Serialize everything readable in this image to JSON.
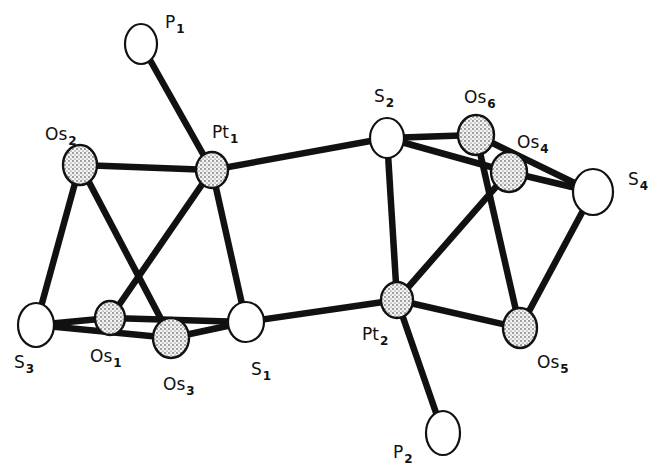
{
  "figure": {
    "type": "molecular structure (ORTEP-style)",
    "atoms": [
      {
        "id": "P1",
        "element": "P",
        "sub": "1",
        "style": "open"
      },
      {
        "id": "Pt1",
        "element": "Pt",
        "sub": "1",
        "style": "stippled"
      },
      {
        "id": "Os2",
        "element": "Os",
        "sub": "2",
        "style": "stippled"
      },
      {
        "id": "S3",
        "element": "S",
        "sub": "3",
        "style": "open"
      },
      {
        "id": "Os1",
        "element": "Os",
        "sub": "1",
        "style": "stippled"
      },
      {
        "id": "Os3",
        "element": "Os",
        "sub": "3",
        "style": "stippled"
      },
      {
        "id": "S1",
        "element": "S",
        "sub": "1",
        "style": "open"
      },
      {
        "id": "S2",
        "element": "S",
        "sub": "2",
        "style": "open"
      },
      {
        "id": "Os6",
        "element": "Os",
        "sub": "6",
        "style": "stippled"
      },
      {
        "id": "Os4",
        "element": "Os",
        "sub": "4",
        "style": "stippled"
      },
      {
        "id": "S4",
        "element": "S",
        "sub": "4",
        "style": "open"
      },
      {
        "id": "Pt2",
        "element": "Pt",
        "sub": "2",
        "style": "stippled"
      },
      {
        "id": "Os5",
        "element": "Os",
        "sub": "5",
        "style": "stippled"
      },
      {
        "id": "P2",
        "element": "P",
        "sub": "2",
        "style": "open"
      }
    ],
    "bonds": [
      [
        "P1",
        "Pt1"
      ],
      [
        "Os2",
        "Pt1"
      ],
      [
        "Pt1",
        "S2"
      ],
      [
        "Pt1",
        "Os1"
      ],
      [
        "Pt1",
        "S1"
      ],
      [
        "Os2",
        "S3"
      ],
      [
        "Os2",
        "Os3"
      ],
      [
        "S3",
        "Os1"
      ],
      [
        "S3",
        "Os3"
      ],
      [
        "Os1",
        "S1"
      ],
      [
        "Os3",
        "S1"
      ],
      [
        "S1",
        "Pt2"
      ],
      [
        "S2",
        "Os6"
      ],
      [
        "S2",
        "Os4"
      ],
      [
        "S2",
        "Pt2"
      ],
      [
        "Os6",
        "Os5"
      ],
      [
        "Os6",
        "S4"
      ],
      [
        "Os4",
        "S4"
      ],
      [
        "Pt2",
        "Os4"
      ],
      [
        "Pt2",
        "Os5"
      ],
      [
        "S4",
        "Os5"
      ],
      [
        "Pt2",
        "P2"
      ]
    ]
  }
}
